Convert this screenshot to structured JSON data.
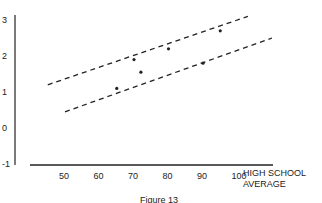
{
  "chart_data": {
    "type": "scatter",
    "title": "",
    "caption": "Figure 13",
    "xlabel": "HIGH SCHOOL AVERAGE",
    "ylabel": "",
    "xlim": [
      40,
      110
    ],
    "ylim": [
      -1,
      3
    ],
    "x_ticks": [
      "50",
      "60",
      "70",
      "80",
      "90",
      "100"
    ],
    "y_ticks": [
      "3",
      "2",
      "1",
      "0",
      "-1"
    ],
    "grid": false,
    "points": [
      {
        "x": 65,
        "y": 1.1
      },
      {
        "x": 70,
        "y": 1.9
      },
      {
        "x": 72,
        "y": 1.55
      },
      {
        "x": 80,
        "y": 2.2
      },
      {
        "x": 90,
        "y": 1.8
      },
      {
        "x": 95,
        "y": 2.7
      }
    ],
    "bands": [
      {
        "name": "upper dashed line",
        "from": {
          "x": 45,
          "y": 1.2
        },
        "to": {
          "x": 103,
          "y": 3.1
        }
      },
      {
        "name": "lower dashed line",
        "from": {
          "x": 50,
          "y": 0.45
        },
        "to": {
          "x": 110,
          "y": 2.5
        }
      }
    ]
  },
  "labels": {
    "x_label_line1": "HIGH SCHOOL",
    "x_label_line2": "AVERAGE",
    "caption": "Figure 13"
  }
}
